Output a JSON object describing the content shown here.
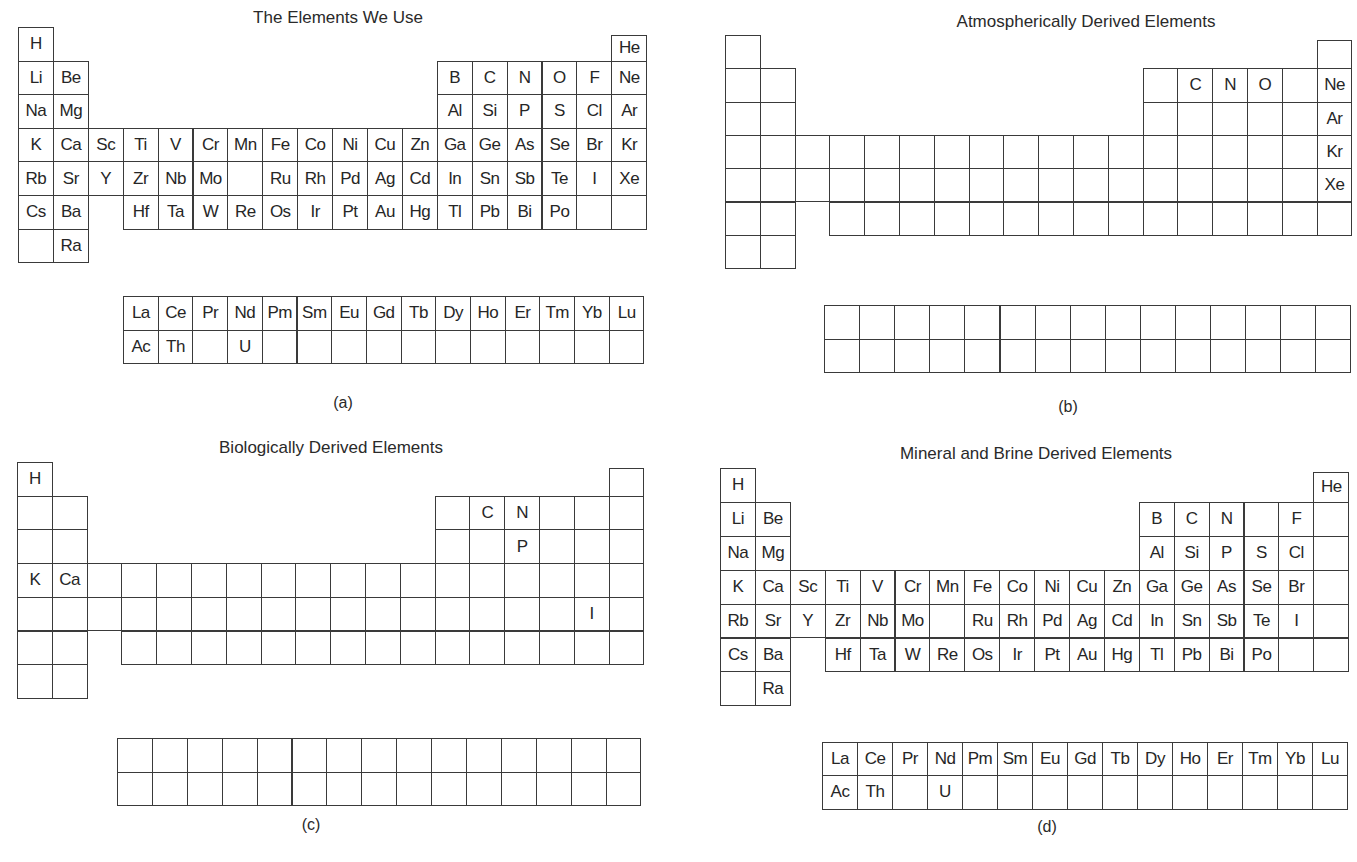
{
  "figure": {
    "panels": [
      {
        "id": "a",
        "title": "The Elements We Use",
        "label": "(a)",
        "main_symbols": {
          "1": [
            "H",
            "",
            "",
            "",
            "",
            "",
            "",
            "",
            "",
            "",
            "",
            "",
            "",
            "",
            "",
            "",
            "",
            "He"
          ],
          "2": [
            "Li",
            "Be",
            "",
            "",
            "",
            "",
            "",
            "",
            "",
            "",
            "",
            "",
            "B",
            "C",
            "N",
            "O",
            "F",
            "Ne"
          ],
          "3": [
            "Na",
            "Mg",
            "",
            "",
            "",
            "",
            "",
            "",
            "",
            "",
            "",
            "",
            "Al",
            "Si",
            "P",
            "S",
            "Cl",
            "Ar"
          ],
          "4": [
            "K",
            "Ca",
            "Sc",
            "Ti",
            "V",
            "Cr",
            "Mn",
            "Fe",
            "Co",
            "Ni",
            "Cu",
            "Zn",
            "Ga",
            "Ge",
            "As",
            "Se",
            "Br",
            "Kr"
          ],
          "5": [
            "Rb",
            "Sr",
            "Y",
            "Zr",
            "Nb",
            "Mo",
            "",
            "Ru",
            "Rh",
            "Pd",
            "Ag",
            "Cd",
            "In",
            "Sn",
            "Sb",
            "Te",
            "I",
            "Xe"
          ],
          "6": [
            "Cs",
            "Ba",
            "",
            "Hf",
            "Ta",
            "W",
            "Re",
            "Os",
            "Ir",
            "Pt",
            "Au",
            "Hg",
            "Tl",
            "Pb",
            "Bi",
            "Po",
            "",
            ""
          ],
          "7": [
            "",
            "Ra",
            "",
            "",
            "",
            "",
            "",
            "",
            "",
            "",
            "",
            "",
            "",
            "",
            "",
            "",
            "",
            ""
          ]
        },
        "f_block": [
          [
            "La",
            "Ce",
            "Pr",
            "Nd",
            "Pm",
            "Sm",
            "Eu",
            "Gd",
            "Tb",
            "Dy",
            "Ho",
            "Er",
            "Tm",
            "Yb",
            "Lu"
          ],
          [
            "Ac",
            "Th",
            "",
            "U",
            "",
            "",
            "",
            "",
            "",
            "",
            "",
            "",
            "",
            "",
            ""
          ]
        ]
      },
      {
        "id": "b",
        "title": "Atmospherically Derived Elements",
        "label": "(b)",
        "main_symbols": {
          "1": [
            "",
            "",
            "",
            "",
            "",
            "",
            "",
            "",
            "",
            "",
            "",
            "",
            "",
            "",
            "",
            "",
            "",
            ""
          ],
          "2": [
            "",
            "",
            "",
            "",
            "",
            "",
            "",
            "",
            "",
            "",
            "",
            "",
            "",
            "C",
            "N",
            "O",
            "",
            "Ne"
          ],
          "3": [
            "",
            "",
            "",
            "",
            "",
            "",
            "",
            "",
            "",
            "",
            "",
            "",
            "",
            "",
            "",
            "",
            "",
            "Ar"
          ],
          "4": [
            "",
            "",
            "",
            "",
            "",
            "",
            "",
            "",
            "",
            "",
            "",
            "",
            "",
            "",
            "",
            "",
            "",
            "Kr"
          ],
          "5": [
            "",
            "",
            "",
            "",
            "",
            "",
            "",
            "",
            "",
            "",
            "",
            "",
            "",
            "",
            "",
            "",
            "",
            "Xe"
          ],
          "6": [
            "",
            "",
            "",
            "",
            "",
            "",
            "",
            "",
            "",
            "",
            "",
            "",
            "",
            "",
            "",
            "",
            "",
            ""
          ],
          "7": [
            "",
            "",
            "",
            "",
            "",
            "",
            "",
            "",
            "",
            "",
            "",
            "",
            "",
            "",
            "",
            "",
            "",
            ""
          ]
        },
        "f_block": [
          [
            "",
            "",
            "",
            "",
            "",
            "",
            "",
            "",
            "",
            "",
            "",
            "",
            "",
            "",
            ""
          ],
          [
            "",
            "",
            "",
            "",
            "",
            "",
            "",
            "",
            "",
            "",
            "",
            "",
            "",
            "",
            ""
          ]
        ]
      },
      {
        "id": "c",
        "title": "Biologically  Derived Elements",
        "label": "(c)",
        "main_symbols": {
          "1": [
            "H",
            "",
            "",
            "",
            "",
            "",
            "",
            "",
            "",
            "",
            "",
            "",
            "",
            "",
            "",
            "",
            "",
            ""
          ],
          "2": [
            "",
            "",
            "",
            "",
            "",
            "",
            "",
            "",
            "",
            "",
            "",
            "",
            "",
            "C",
            "N",
            "",
            "",
            ""
          ],
          "3": [
            "",
            "",
            "",
            "",
            "",
            "",
            "",
            "",
            "",
            "",
            "",
            "",
            "",
            "",
            "P",
            "",
            "",
            ""
          ],
          "4": [
            "K",
            "Ca",
            "",
            "",
            "",
            "",
            "",
            "",
            "",
            "",
            "",
            "",
            "",
            "",
            "",
            "",
            "",
            ""
          ],
          "5": [
            "",
            "",
            "",
            "",
            "",
            "",
            "",
            "",
            "",
            "",
            "",
            "",
            "",
            "",
            "",
            "",
            "I",
            ""
          ],
          "6": [
            "",
            "",
            "",
            "",
            "",
            "",
            "",
            "",
            "",
            "",
            "",
            "",
            "",
            "",
            "",
            "",
            "",
            ""
          ],
          "7": [
            "",
            "",
            "",
            "",
            "",
            "",
            "",
            "",
            "",
            "",
            "",
            "",
            "",
            "",
            "",
            "",
            "",
            ""
          ]
        },
        "f_block": [
          [
            "",
            "",
            "",
            "",
            "",
            "",
            "",
            "",
            "",
            "",
            "",
            "",
            "",
            "",
            ""
          ],
          [
            "",
            "",
            "",
            "",
            "",
            "",
            "",
            "",
            "",
            "",
            "",
            "",
            "",
            "",
            ""
          ]
        ]
      },
      {
        "id": "d",
        "title": "Mineral and Brine Derived Elements",
        "label": "(d)",
        "main_symbols": {
          "1": [
            "H",
            "",
            "",
            "",
            "",
            "",
            "",
            "",
            "",
            "",
            "",
            "",
            "",
            "",
            "",
            "",
            "",
            "He"
          ],
          "2": [
            "Li",
            "Be",
            "",
            "",
            "",
            "",
            "",
            "",
            "",
            "",
            "",
            "",
            "B",
            "C",
            "N",
            "",
            "F",
            ""
          ],
          "3": [
            "Na",
            "Mg",
            "",
            "",
            "",
            "",
            "",
            "",
            "",
            "",
            "",
            "",
            "Al",
            "Si",
            "P",
            "S",
            "Cl",
            ""
          ],
          "4": [
            "K",
            "Ca",
            "Sc",
            "Ti",
            "V",
            "Cr",
            "Mn",
            "Fe",
            "Co",
            "Ni",
            "Cu",
            "Zn",
            "Ga",
            "Ge",
            "As",
            "Se",
            "Br",
            ""
          ],
          "5": [
            "Rb",
            "Sr",
            "Y",
            "Zr",
            "Nb",
            "Mo",
            "",
            "Ru",
            "Rh",
            "Pd",
            "Ag",
            "Cd",
            "In",
            "Sn",
            "Sb",
            "Te",
            "I",
            ""
          ],
          "6": [
            "Cs",
            "Ba",
            "",
            "Hf",
            "Ta",
            "W",
            "Re",
            "Os",
            "Ir",
            "Pt",
            "Au",
            "Hg",
            "Tl",
            "Pb",
            "Bi",
            "Po",
            "",
            ""
          ],
          "7": [
            "",
            "Ra",
            "",
            "",
            "",
            "",
            "",
            "",
            "",
            "",
            "",
            "",
            "",
            "",
            "",
            "",
            "",
            ""
          ]
        },
        "f_block": [
          [
            "La",
            "Ce",
            "Pr",
            "Nd",
            "Pm",
            "Sm",
            "Eu",
            "Gd",
            "Tb",
            "Dy",
            "Ho",
            "Er",
            "Tm",
            "Yb",
            "Lu"
          ],
          [
            "Ac",
            "Th",
            "",
            "U",
            "",
            "",
            "",
            "",
            "",
            "",
            "",
            "",
            "",
            "",
            ""
          ]
        ]
      }
    ]
  }
}
